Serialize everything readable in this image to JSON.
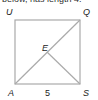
{
  "caption": "below, has length 4.",
  "diagram": {
    "type": "square with diagonal",
    "labels": {
      "top_left": "U",
      "top_right": "Q",
      "center": "E",
      "bottom_left": "A",
      "bottom_right": "S",
      "bottom_side_length": "5"
    },
    "line_color": "#aaaaaa",
    "text_color": "#222222"
  }
}
